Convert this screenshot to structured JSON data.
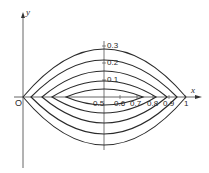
{
  "diagram": {
    "axes": {
      "x_label": "x",
      "y_label": "y",
      "origin_label": "O"
    },
    "x_ticks": [
      {
        "label": "0.5",
        "value": 0.5
      },
      {
        "label": "0.6",
        "value": 0.6
      },
      {
        "label": "0.7",
        "value": 0.7
      },
      {
        "label": "0.8",
        "value": 0.8
      },
      {
        "label": "0.9",
        "value": 0.9
      },
      {
        "label": "1",
        "value": 1.0
      }
    ],
    "y_ticks": [
      {
        "label": "0.1",
        "value": 0.1
      },
      {
        "label": "0.2",
        "value": 0.2
      },
      {
        "label": "0.3",
        "value": 0.3
      }
    ],
    "curves": [
      {
        "name": "lens-1",
        "x_left": 0.0,
        "x_right": 1.0,
        "half_height_px": 48
      },
      {
        "name": "lens-2",
        "x_left": 0.05,
        "x_right": 0.95,
        "half_height_px": 37
      },
      {
        "name": "lens-3",
        "x_left": 0.12,
        "x_right": 0.89,
        "half_height_px": 26
      },
      {
        "name": "lens-4",
        "x_left": 0.18,
        "x_right": 0.83,
        "half_height_px": 16
      },
      {
        "name": "lens-5",
        "x_left": 0.27,
        "x_right": 0.74,
        "half_height_px": 8
      }
    ],
    "colors": {
      "line": "#2a2a2a",
      "axis": "#555555",
      "background": "#ffffff"
    }
  }
}
